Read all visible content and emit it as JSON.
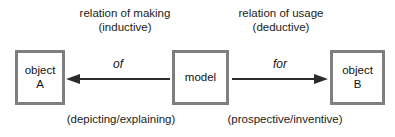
{
  "diagram": {
    "type": "relation-diagram",
    "background_color": "#ffffff",
    "box_border_color": "#7f7f7f",
    "text_color": "#1a1a1a",
    "arrow_color": "#2b2b2b"
  },
  "captions": {
    "making": {
      "line1": "relation of making",
      "line2": "(inductive)"
    },
    "usage": {
      "line1": "relation of usage",
      "line2": "(deductive)"
    },
    "depicting": {
      "text": "(depicting/explaining)"
    },
    "prospective": {
      "text": "(prospective/inventive)"
    }
  },
  "nodes": {
    "object_a": {
      "line1": "object",
      "line2": "A"
    },
    "model": {
      "line1": "model"
    },
    "object_b": {
      "line1": "object",
      "line2": "B"
    }
  },
  "arrows": {
    "of": {
      "label": "of",
      "direction": "left",
      "from": "model",
      "to": "object A"
    },
    "for": {
      "label": "for",
      "direction": "right",
      "from": "model",
      "to": "object B"
    }
  }
}
